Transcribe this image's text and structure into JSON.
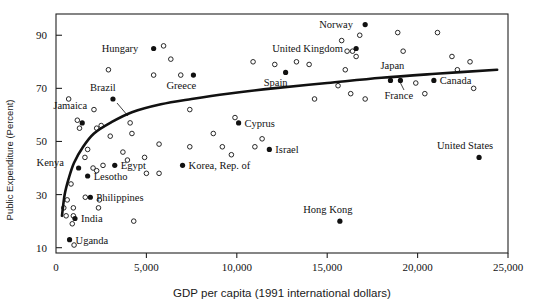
{
  "chart_data": {
    "type": "scatter",
    "title": "",
    "xlabel": "GDP per capita (1991 international dollars)",
    "ylabel": "Public Expenditure (Percent)",
    "xlim": [
      0,
      25000
    ],
    "ylim": [
      8,
      98
    ],
    "grid": false,
    "legend": "none",
    "xticks": [
      0,
      5000,
      10000,
      15000,
      20000,
      25000
    ],
    "xtick_labels": [
      "0",
      "5,000",
      "10,000",
      "15,000",
      "20,000",
      "25,000"
    ],
    "yticks": [
      10,
      30,
      50,
      70,
      90
    ],
    "ytick_labels": [
      "10",
      "30",
      "50",
      "70",
      "90"
    ],
    "marker_styles": {
      "labeled": "filled-circle",
      "unlabeled": "open-circle"
    },
    "fit_curve": {
      "name": "logarithmic trend line",
      "style": "solid-thick-black",
      "points": [
        [
          330,
          22
        ],
        [
          480,
          30
        ],
        [
          700,
          36
        ],
        [
          1000,
          42
        ],
        [
          1500,
          48
        ],
        [
          2100,
          53
        ],
        [
          3000,
          57
        ],
        [
          4200,
          61
        ],
        [
          5800,
          64
        ],
        [
          7500,
          66
        ],
        [
          9500,
          68
        ],
        [
          12000,
          70
        ],
        [
          15000,
          72
        ],
        [
          18000,
          74
        ],
        [
          21000,
          75.5
        ],
        [
          24400,
          77
        ]
      ]
    },
    "labeled_points": [
      {
        "name": "Uganda",
        "x": 750,
        "y": 13,
        "label_dx": 6,
        "label_dy": 4
      },
      {
        "name": "India",
        "x": 1050,
        "y": 21,
        "label_dx": 6,
        "label_dy": 4
      },
      {
        "name": "Philippines",
        "x": 1900,
        "y": 29,
        "label_dx": 6,
        "label_dy": 4
      },
      {
        "name": "Lesotho",
        "x": 1750,
        "y": 37,
        "label_dx": 6,
        "label_dy": 4
      },
      {
        "name": "Kenya",
        "x": 1250,
        "y": 40,
        "label_dx": -42,
        "label_dy": -2
      },
      {
        "name": "Egypt",
        "x": 3250,
        "y": 41,
        "label_dx": 6,
        "label_dy": 4
      },
      {
        "name": "Korea, Rep. of",
        "x": 7000,
        "y": 41,
        "label_dx": 6,
        "label_dy": 4
      },
      {
        "name": "Jamaica",
        "x": 1450,
        "y": 57,
        "label_dx": -12,
        "label_dy": -14
      },
      {
        "name": "Brazil",
        "x": 3150,
        "y": 66,
        "label_dx": -10,
        "label_dy": -8
      },
      {
        "name": "Israel",
        "x": 11800,
        "y": 47,
        "label_dx": 6,
        "label_dy": 4
      },
      {
        "name": "Cyprus",
        "x": 10100,
        "y": 57,
        "label_dx": 6,
        "label_dy": 4
      },
      {
        "name": "Greece",
        "x": 7600,
        "y": 75,
        "label_dx": -12,
        "label_dy": 14
      },
      {
        "name": "Spain",
        "x": 12700,
        "y": 76,
        "label_dx": -10,
        "label_dy": 14
      },
      {
        "name": "Hungary",
        "x": 5400,
        "y": 85,
        "label_dx": -52,
        "label_dy": 3
      },
      {
        "name": "Norway",
        "x": 17100,
        "y": 94,
        "label_dx": -46,
        "label_dy": 3
      },
      {
        "name": "United Kingdom",
        "x": 16600,
        "y": 85,
        "label_dx": -84,
        "label_dy": 3
      },
      {
        "name": "Japan",
        "x": 19050,
        "y": 73,
        "label_dx": -8,
        "label_dy": -11
      },
      {
        "name": "France",
        "x": 18500,
        "y": 73,
        "label_dx": -6,
        "label_dy": 19
      },
      {
        "name": "Canada",
        "x": 20900,
        "y": 73,
        "label_dx": 6,
        "label_dy": 4
      },
      {
        "name": "Hong Kong",
        "x": 15700,
        "y": 20,
        "label_dx": -12,
        "label_dy": -8
      },
      {
        "name": "United States",
        "x": 23400,
        "y": 44,
        "label_dx": -14,
        "label_dy": -8
      }
    ],
    "unlabeled_points": [
      {
        "x": 430,
        "y": 25
      },
      {
        "x": 560,
        "y": 22
      },
      {
        "x": 830,
        "y": 34
      },
      {
        "x": 620,
        "y": 28
      },
      {
        "x": 900,
        "y": 19
      },
      {
        "x": 960,
        "y": 22
      },
      {
        "x": 960,
        "y": 25
      },
      {
        "x": 1000,
        "y": 11
      },
      {
        "x": 1750,
        "y": 47
      },
      {
        "x": 1600,
        "y": 44
      },
      {
        "x": 1620,
        "y": 29
      },
      {
        "x": 2050,
        "y": 40
      },
      {
        "x": 2250,
        "y": 39
      },
      {
        "x": 2350,
        "y": 25
      },
      {
        "x": 2400,
        "y": 28
      },
      {
        "x": 2600,
        "y": 41
      },
      {
        "x": 1180,
        "y": 58
      },
      {
        "x": 1300,
        "y": 55
      },
      {
        "x": 700,
        "y": 66
      },
      {
        "x": 2100,
        "y": 62
      },
      {
        "x": 2250,
        "y": 55
      },
      {
        "x": 2500,
        "y": 56
      },
      {
        "x": 3000,
        "y": 52
      },
      {
        "x": 2900,
        "y": 77
      },
      {
        "x": 3700,
        "y": 46
      },
      {
        "x": 3950,
        "y": 43
      },
      {
        "x": 4100,
        "y": 57
      },
      {
        "x": 4200,
        "y": 53
      },
      {
        "x": 4300,
        "y": 20
      },
      {
        "x": 4900,
        "y": 44
      },
      {
        "x": 5000,
        "y": 38
      },
      {
        "x": 5400,
        "y": 75
      },
      {
        "x": 5700,
        "y": 38
      },
      {
        "x": 5700,
        "y": 49
      },
      {
        "x": 5950,
        "y": 86
      },
      {
        "x": 6350,
        "y": 81
      },
      {
        "x": 6900,
        "y": 75
      },
      {
        "x": 7400,
        "y": 62
      },
      {
        "x": 7400,
        "y": 48
      },
      {
        "x": 8700,
        "y": 53
      },
      {
        "x": 9200,
        "y": 48
      },
      {
        "x": 9700,
        "y": 45
      },
      {
        "x": 9900,
        "y": 59
      },
      {
        "x": 10900,
        "y": 80
      },
      {
        "x": 11000,
        "y": 48
      },
      {
        "x": 11400,
        "y": 51
      },
      {
        "x": 12100,
        "y": 79
      },
      {
        "x": 13300,
        "y": 80
      },
      {
        "x": 14300,
        "y": 66
      },
      {
        "x": 14000,
        "y": 79
      },
      {
        "x": 15800,
        "y": 88
      },
      {
        "x": 16100,
        "y": 84
      },
      {
        "x": 16800,
        "y": 90
      },
      {
        "x": 16400,
        "y": 84
      },
      {
        "x": 16600,
        "y": 82
      },
      {
        "x": 16000,
        "y": 77
      },
      {
        "x": 15600,
        "y": 71
      },
      {
        "x": 16300,
        "y": 68
      },
      {
        "x": 17100,
        "y": 66
      },
      {
        "x": 19900,
        "y": 72
      },
      {
        "x": 18900,
        "y": 91
      },
      {
        "x": 21100,
        "y": 91
      },
      {
        "x": 20400,
        "y": 68
      },
      {
        "x": 22200,
        "y": 77
      },
      {
        "x": 23100,
        "y": 70
      },
      {
        "x": 22900,
        "y": 80
      },
      {
        "x": 21900,
        "y": 82
      },
      {
        "x": 19200,
        "y": 84
      }
    ]
  }
}
